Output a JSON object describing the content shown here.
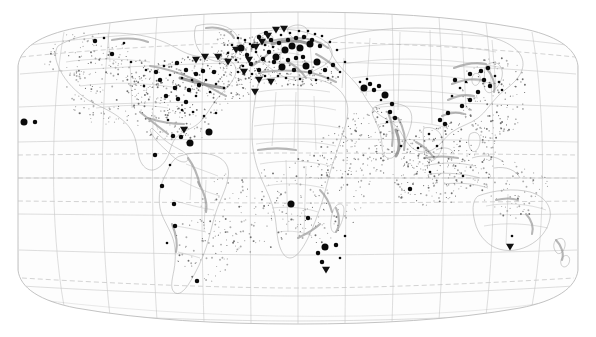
{
  "figure": {
    "kind": "world-distribution-map",
    "projection": "robinson",
    "width": 596,
    "height": 337,
    "background_color": "#ffffff",
    "frame_color": "#b4b4b4",
    "graticule_color": "#c8c8c8",
    "marker_color": "#0a0a0a",
    "scatter_color": "#6f6f6f",
    "coast_shade_color": "#9a9a9a",
    "title": "",
    "subtitle": "",
    "caption": "",
    "legend": []
  },
  "chart_data": {
    "type": "scatter",
    "title": "",
    "xlabel": "",
    "ylabel": "",
    "xlim": [
      -180,
      180
    ],
    "ylim": [
      -90,
      90
    ],
    "grid": true,
    "legend_position": "none",
    "graticule": {
      "meridian_step_degrees": 30,
      "parallel_step_degrees": 20,
      "dashed_parallels": [
        23.5,
        -23.5,
        0,
        66.5,
        -66.5
      ],
      "solid_parallels": [
        60,
        40,
        20,
        0,
        -20,
        -40,
        -60
      ],
      "meridians": [
        -180,
        -150,
        -120,
        -90,
        -60,
        -30,
        0,
        30,
        60,
        90,
        120,
        150,
        180
      ]
    },
    "series": [
      {
        "name": "large-sites",
        "marker": "circle",
        "size_px": 7,
        "color": "#0a0a0a",
        "points": [
          {
            "x": 285,
            "y": 50
          },
          {
            "x": 276,
            "y": 57
          },
          {
            "x": 292,
            "y": 46
          },
          {
            "x": 300,
            "y": 48
          },
          {
            "x": 310,
            "y": 44
          },
          {
            "x": 282,
            "y": 67
          },
          {
            "x": 317,
            "y": 62
          },
          {
            "x": 306,
            "y": 66
          },
          {
            "x": 241,
            "y": 48
          },
          {
            "x": 385,
            "y": 95
          },
          {
            "x": 364,
            "y": 88
          },
          {
            "x": 190,
            "y": 143
          },
          {
            "x": 291,
            "y": 204
          },
          {
            "x": 325,
            "y": 247
          },
          {
            "x": 24,
            "y": 122
          },
          {
            "x": 209,
            "y": 132
          }
        ]
      },
      {
        "name": "medium-sites",
        "marker": "circle",
        "size_px": 4.5,
        "color": "#0a0a0a",
        "points": [
          {
            "x": 271,
            "y": 40
          },
          {
            "x": 279,
            "y": 43
          },
          {
            "x": 288,
            "y": 40
          },
          {
            "x": 296,
            "y": 38
          },
          {
            "x": 304,
            "y": 37
          },
          {
            "x": 312,
            "y": 40
          },
          {
            "x": 320,
            "y": 46
          },
          {
            "x": 269,
            "y": 52
          },
          {
            "x": 263,
            "y": 59
          },
          {
            "x": 274,
            "y": 62
          },
          {
            "x": 288,
            "y": 60
          },
          {
            "x": 296,
            "y": 58
          },
          {
            "x": 303,
            "y": 57
          },
          {
            "x": 294,
            "y": 70
          },
          {
            "x": 310,
            "y": 72
          },
          {
            "x": 325,
            "y": 70
          },
          {
            "x": 333,
            "y": 65
          },
          {
            "x": 259,
            "y": 70
          },
          {
            "x": 251,
            "y": 64
          },
          {
            "x": 247,
            "y": 55
          },
          {
            "x": 253,
            "y": 46
          },
          {
            "x": 259,
            "y": 37
          },
          {
            "x": 266,
            "y": 33
          },
          {
            "x": 177,
            "y": 63
          },
          {
            "x": 186,
            "y": 70
          },
          {
            "x": 196,
            "y": 74
          },
          {
            "x": 203,
            "y": 71
          },
          {
            "x": 214,
            "y": 72
          },
          {
            "x": 199,
            "y": 85
          },
          {
            "x": 189,
            "y": 90
          },
          {
            "x": 175,
            "y": 88
          },
          {
            "x": 166,
            "y": 96
          },
          {
            "x": 178,
            "y": 99
          },
          {
            "x": 186,
            "y": 102
          },
          {
            "x": 95,
            "y": 41
          },
          {
            "x": 112,
            "y": 54
          },
          {
            "x": 156,
            "y": 72
          },
          {
            "x": 160,
            "y": 80
          },
          {
            "x": 173,
            "y": 136
          },
          {
            "x": 181,
            "y": 137
          },
          {
            "x": 155,
            "y": 155
          },
          {
            "x": 162,
            "y": 186
          },
          {
            "x": 174,
            "y": 204
          },
          {
            "x": 175,
            "y": 226
          },
          {
            "x": 197,
            "y": 281
          },
          {
            "x": 35,
            "y": 122
          },
          {
            "x": 370,
            "y": 84
          },
          {
            "x": 374,
            "y": 90
          },
          {
            "x": 379,
            "y": 86
          },
          {
            "x": 392,
            "y": 104
          },
          {
            "x": 390,
            "y": 112
          },
          {
            "x": 395,
            "y": 118
          },
          {
            "x": 455,
            "y": 80
          },
          {
            "x": 470,
            "y": 74
          },
          {
            "x": 481,
            "y": 71
          },
          {
            "x": 488,
            "y": 68
          },
          {
            "x": 484,
            "y": 80
          },
          {
            "x": 490,
            "y": 86
          },
          {
            "x": 478,
            "y": 92
          },
          {
            "x": 470,
            "y": 100
          },
          {
            "x": 462,
            "y": 106
          },
          {
            "x": 448,
            "y": 113
          },
          {
            "x": 440,
            "y": 120
          },
          {
            "x": 445,
            "y": 124
          },
          {
            "x": 410,
            "y": 189
          },
          {
            "x": 336,
            "y": 245
          },
          {
            "x": 308,
            "y": 218
          },
          {
            "x": 318,
            "y": 253
          },
          {
            "x": 322,
            "y": 262
          }
        ]
      },
      {
        "name": "small-sites",
        "marker": "circle",
        "size_px": 2.6,
        "color": "#111111",
        "points": [
          {
            "x": 265,
            "y": 45
          },
          {
            "x": 273,
            "y": 47
          },
          {
            "x": 281,
            "y": 35
          },
          {
            "x": 290,
            "y": 33
          },
          {
            "x": 299,
            "y": 31
          },
          {
            "x": 308,
            "y": 31
          },
          {
            "x": 315,
            "y": 34
          },
          {
            "x": 322,
            "y": 36
          },
          {
            "x": 330,
            "y": 42
          },
          {
            "x": 337,
            "y": 50
          },
          {
            "x": 256,
            "y": 52
          },
          {
            "x": 250,
            "y": 44
          },
          {
            "x": 245,
            "y": 40
          },
          {
            "x": 238,
            "y": 38
          },
          {
            "x": 232,
            "y": 45
          },
          {
            "x": 228,
            "y": 53
          },
          {
            "x": 236,
            "y": 60
          },
          {
            "x": 243,
            "y": 66
          },
          {
            "x": 238,
            "y": 72
          },
          {
            "x": 252,
            "y": 74
          },
          {
            "x": 265,
            "y": 76
          },
          {
            "x": 278,
            "y": 76
          },
          {
            "x": 286,
            "y": 78
          },
          {
            "x": 300,
            "y": 79
          },
          {
            "x": 316,
            "y": 80
          },
          {
            "x": 328,
            "y": 78
          },
          {
            "x": 340,
            "y": 72
          },
          {
            "x": 345,
            "y": 62
          },
          {
            "x": 164,
            "y": 66
          },
          {
            "x": 170,
            "y": 75
          },
          {
            "x": 182,
            "y": 78
          },
          {
            "x": 192,
            "y": 80
          },
          {
            "x": 206,
            "y": 80
          },
          {
            "x": 216,
            "y": 84
          },
          {
            "x": 224,
            "y": 88
          },
          {
            "x": 210,
            "y": 92
          },
          {
            "x": 196,
            "y": 96
          },
          {
            "x": 182,
            "y": 110
          },
          {
            "x": 193,
            "y": 112
          },
          {
            "x": 204,
            "y": 116
          },
          {
            "x": 216,
            "y": 113
          },
          {
            "x": 124,
            "y": 43
          },
          {
            "x": 104,
            "y": 38
          },
          {
            "x": 131,
            "y": 62
          },
          {
            "x": 146,
            "y": 70
          },
          {
            "x": 144,
            "y": 86
          },
          {
            "x": 168,
            "y": 120
          },
          {
            "x": 186,
            "y": 128
          },
          {
            "x": 170,
            "y": 165
          },
          {
            "x": 167,
            "y": 243
          },
          {
            "x": 360,
            "y": 82
          },
          {
            "x": 367,
            "y": 79
          },
          {
            "x": 381,
            "y": 100
          },
          {
            "x": 387,
            "y": 122
          },
          {
            "x": 401,
            "y": 146
          },
          {
            "x": 418,
            "y": 148
          },
          {
            "x": 429,
            "y": 134
          },
          {
            "x": 437,
            "y": 146
          },
          {
            "x": 452,
            "y": 96
          },
          {
            "x": 460,
            "y": 88
          },
          {
            "x": 466,
            "y": 82
          },
          {
            "x": 495,
            "y": 76
          },
          {
            "x": 499,
            "y": 82
          },
          {
            "x": 502,
            "y": 90
          },
          {
            "x": 430,
            "y": 172
          },
          {
            "x": 463,
            "y": 176
          },
          {
            "x": 512,
            "y": 236
          },
          {
            "x": 340,
            "y": 258
          },
          {
            "x": 345,
            "y": 236
          }
        ]
      },
      {
        "name": "triangle-sites",
        "marker": "triangle-down",
        "size_px": 4,
        "color": "#111111",
        "points": [
          {
            "x": 262,
            "y": 42
          },
          {
            "x": 268,
            "y": 36
          },
          {
            "x": 256,
            "y": 47
          },
          {
            "x": 249,
            "y": 60
          },
          {
            "x": 244,
            "y": 72
          },
          {
            "x": 259,
            "y": 80
          },
          {
            "x": 271,
            "y": 82
          },
          {
            "x": 276,
            "y": 30
          },
          {
            "x": 284,
            "y": 29
          },
          {
            "x": 218,
            "y": 57
          },
          {
            "x": 228,
            "y": 62
          },
          {
            "x": 205,
            "y": 57
          },
          {
            "x": 196,
            "y": 60
          },
          {
            "x": 236,
            "y": 50
          },
          {
            "x": 184,
            "y": 130
          },
          {
            "x": 255,
            "y": 92
          },
          {
            "x": 510,
            "y": 247
          },
          {
            "x": 326,
            "y": 270
          }
        ]
      }
    ],
    "scatter_cloud": {
      "name": "background-occurrence-points",
      "color": "#6f6f6f",
      "approx_count": 1400,
      "regions": [
        "north-atlantic",
        "north-pacific",
        "mediterranean",
        "caribbean",
        "indian-ocean",
        "coral-triangle",
        "south-pacific",
        "gulf-of-mexico",
        "east-asia-seas"
      ]
    }
  }
}
